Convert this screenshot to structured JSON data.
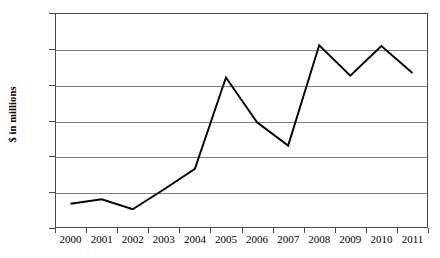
{
  "chart_data": {
    "type": "line",
    "title": "",
    "xlabel": "",
    "ylabel": "$ in millions",
    "categories": [
      "2000",
      "2001",
      "2002",
      "2003",
      "2004",
      "2005",
      "2006",
      "2007",
      "2008",
      "2009",
      "2010",
      "2011"
    ],
    "values": [
      1.35,
      1.6,
      1.05,
      2.15,
      3.3,
      8.4,
      5.9,
      4.6,
      10.2,
      8.5,
      10.15,
      8.65
    ],
    "series": [
      {
        "name": "",
        "values": [
          1.35,
          1.6,
          1.05,
          2.15,
          3.3,
          8.4,
          5.9,
          4.6,
          10.2,
          8.5,
          10.15,
          8.65
        ]
      }
    ],
    "ylim": [
      0,
      12
    ],
    "yticks": [
      0,
      2,
      4,
      6,
      8,
      10,
      12
    ],
    "ytick_labels": [
      "0",
      "2",
      "4",
      "6",
      "8",
      "10",
      "12"
    ],
    "grid": true,
    "grid_axis": "y",
    "legend": false,
    "legend_position": "none",
    "line_color": "#000000",
    "grid_color": "#808080",
    "frame_color": "#4a4a4a",
    "background_color": "#ffffff",
    "markers": false
  }
}
